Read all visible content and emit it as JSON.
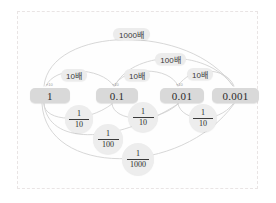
{
  "diagram": {
    "frame": {
      "style": "dashed-border"
    },
    "nodes": [
      {
        "id": "one",
        "label": "1",
        "x": 30,
        "y": 88,
        "w": 40,
        "h": 15
      },
      {
        "id": "tenth",
        "label": "0.1",
        "x": 96,
        "y": 88,
        "w": 42,
        "h": 15
      },
      {
        "id": "hundredth",
        "label": "0.01",
        "x": 160,
        "y": 88,
        "w": 44,
        "h": 15
      },
      {
        "id": "thousandth",
        "label": "0.001",
        "x": 212,
        "y": 88,
        "w": 47,
        "h": 15
      }
    ],
    "multiplier_labels": [
      {
        "id": "m10-a",
        "text": "10배",
        "x": 61,
        "y": 69,
        "w": 26,
        "h": 12
      },
      {
        "id": "m10-b",
        "text": "10배",
        "x": 124,
        "y": 69,
        "w": 26,
        "h": 12
      },
      {
        "id": "m10-c",
        "text": "10배",
        "x": 187,
        "y": 68,
        "w": 26,
        "h": 12
      },
      {
        "id": "m100",
        "text": "100배",
        "x": 155,
        "y": 53,
        "w": 31,
        "h": 12
      },
      {
        "id": "m1000",
        "text": "1000배",
        "x": 113,
        "y": 28,
        "w": 37,
        "h": 12
      }
    ],
    "fraction_bubbles": [
      {
        "id": "f10-a",
        "numerator": "1",
        "denominator": "10",
        "x": 65,
        "y": 105,
        "d": 28
      },
      {
        "id": "f100-a",
        "numerator": "1",
        "denominator": "100",
        "x": 93,
        "y": 124,
        "d": 30
      },
      {
        "id": "f10-b",
        "numerator": "1",
        "denominator": "10",
        "x": 128,
        "y": 102,
        "d": 30
      },
      {
        "id": "f1000",
        "numerator": "1",
        "denominator": "1000",
        "x": 122,
        "y": 143,
        "d": 32
      },
      {
        "id": "f10-c",
        "numerator": "1",
        "denominator": "10",
        "x": 189,
        "y": 104,
        "d": 28
      }
    ],
    "tick_marks": [
      {
        "id": "t1",
        "text": "×10",
        "x": 46,
        "y": 82
      },
      {
        "id": "t2",
        "text": "×10",
        "x": 112,
        "y": 82
      },
      {
        "id": "t3",
        "text": "×10",
        "x": 176,
        "y": 82
      }
    ],
    "colors": {
      "node_bg": "#d9d9d9",
      "label_bg": "#ececec",
      "bubble_bg": "#ededed",
      "arc_stroke": "#d2d2d2",
      "frame_border": "#e9e4e4",
      "page_bg": "#ffffff",
      "text": "#2b2b2b"
    }
  }
}
